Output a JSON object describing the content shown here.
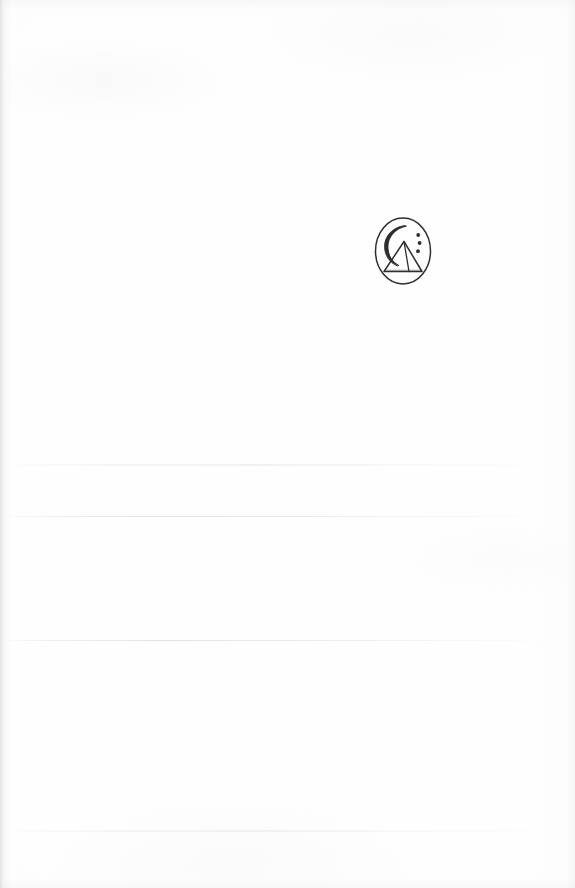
{
  "document": {
    "page_type": "blank-scanned-page",
    "background_color": "#fefefe",
    "ink_color": "#2b2b2b",
    "width": 575,
    "height": 888,
    "body_text": "",
    "page_number": ""
  },
  "logo": {
    "name": "pyramid-crescent-logo",
    "alt_text": "Oval emblem containing a crescent moon, a pyramid and three dots",
    "shape": "oval",
    "stroke_color": "#2e2e2e",
    "elements": [
      {
        "name": "oval-outline",
        "type": "ellipse"
      },
      {
        "name": "crescent-moon",
        "type": "arc"
      },
      {
        "name": "pyramid",
        "type": "triangle"
      },
      {
        "name": "dots",
        "type": "circles",
        "count": 3
      }
    ],
    "position": {
      "left": 373,
      "top": 214,
      "width": 60,
      "height": 74
    }
  },
  "artifacts": {
    "creases": [
      {
        "name": "crease-upper",
        "top": 464,
        "variant": "soft"
      },
      {
        "name": "crease-middle",
        "top": 516,
        "variant": "line"
      },
      {
        "name": "crease-lower",
        "top": 640,
        "variant": "line"
      },
      {
        "name": "crease-bottom",
        "top": 830,
        "variant": "soft"
      }
    ]
  }
}
